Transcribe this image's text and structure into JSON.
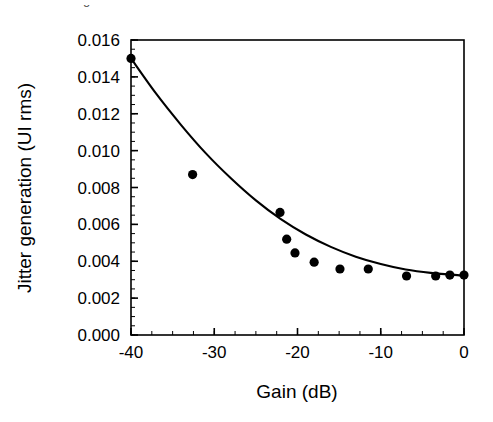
{
  "caption_fragment": "from configuration.",
  "chart_data": {
    "type": "scatter",
    "title": "",
    "xlabel": "Gain (dB)",
    "ylabel": "Jitter generation (UI rms)",
    "xlim": [
      -40,
      0
    ],
    "ylim": [
      0.0,
      0.016
    ],
    "xticks": [
      -40,
      -30,
      -20,
      -10,
      0
    ],
    "xtick_labels": [
      "-40",
      "-30",
      "-20",
      "-10",
      "0"
    ],
    "yticks": [
      0.0,
      0.002,
      0.004,
      0.006,
      0.008,
      0.01,
      0.012,
      0.014,
      0.016
    ],
    "ytick_labels": [
      "0.000",
      "0.002",
      "0.004",
      "0.006",
      "0.008",
      "0.010",
      "0.012",
      "0.014",
      "0.016"
    ],
    "x_minor_tick_step": 2.5,
    "y_minor_tick_step": 0.0005,
    "grid": false,
    "legend": null,
    "marker": "filled-circle",
    "marker_color": "#000000",
    "line_color": "#000000",
    "points": [
      {
        "x": -40.0,
        "y": 0.015
      },
      {
        "x": -32.6,
        "y": 0.0087
      },
      {
        "x": -22.1,
        "y": 0.00665
      },
      {
        "x": -21.3,
        "y": 0.0052
      },
      {
        "x": -20.3,
        "y": 0.00445
      },
      {
        "x": -18.0,
        "y": 0.00395
      },
      {
        "x": -14.9,
        "y": 0.00358
      },
      {
        "x": -11.5,
        "y": 0.00358
      },
      {
        "x": -6.9,
        "y": 0.0032
      },
      {
        "x": -3.4,
        "y": 0.0032
      },
      {
        "x": -1.7,
        "y": 0.00325
      },
      {
        "x": 0.0,
        "y": 0.00325
      }
    ],
    "fit_curve": {
      "description": "smooth monotonic decay from 0.0150 at -40 dB to 0.0032 at 0 dB",
      "x": [
        -40,
        -37,
        -34,
        -31,
        -28,
        -25,
        -22,
        -19,
        -16,
        -13,
        -10,
        -7,
        -4,
        0
      ],
      "y": [
        0.015,
        0.0131,
        0.0114,
        0.00985,
        0.0085,
        0.0073,
        0.00628,
        0.00545,
        0.00478,
        0.00425,
        0.00385,
        0.00355,
        0.00337,
        0.00322
      ]
    }
  }
}
